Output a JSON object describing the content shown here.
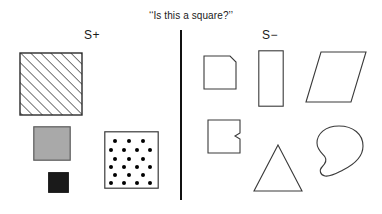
{
  "figure": {
    "title": "‘‘Is this a square?’’",
    "background_color": "#ffffff",
    "width": 382,
    "height": 214
  },
  "divider": {
    "name": "vertical-divider",
    "color": "#111111",
    "orientation": "vertical"
  },
  "categories": {
    "positive": {
      "label": "S+",
      "meaning": "positive-exemplars"
    },
    "negative": {
      "label": "S−",
      "meaning": "negative-exemplars"
    }
  },
  "colors": {
    "outline": "#3a3a3a",
    "hatch": "#2b2b2b",
    "gray_fill": "#a9a9a9",
    "black_fill": "#1a1a1a",
    "dot_fill": "#000000",
    "divider": "#111111",
    "text": "#1a1a1a"
  },
  "positive_shapes": [
    {
      "name": "hatched-square",
      "description": "square with diagonal hatch lines",
      "fill": "hatched",
      "x": 19,
      "y": 52,
      "width": 64,
      "height": 64
    },
    {
      "name": "gray-square",
      "description": "solid gray filled square",
      "fill": "#a9a9a9",
      "x": 33,
      "y": 126,
      "width": 38,
      "height": 35
    },
    {
      "name": "black-square",
      "description": "small solid black square",
      "fill": "#1a1a1a",
      "x": 48,
      "y": 172,
      "width": 21,
      "height": 21
    },
    {
      "name": "dotted-square",
      "description": "white square filled with staggered dot pattern",
      "fill": "dots",
      "x": 104,
      "y": 131,
      "width": 55,
      "height": 58,
      "dot_rows": 6,
      "dot_counts": [
        3,
        4,
        3,
        4,
        3,
        4
      ]
    }
  ],
  "negative_shapes": [
    {
      "name": "beveled-corner-square",
      "description": "square with clipped top-right corner",
      "x": 203,
      "y": 55,
      "width": 34,
      "height": 35
    },
    {
      "name": "tall-rectangle",
      "description": "tall vertical rectangle",
      "x": 258,
      "y": 50,
      "width": 26,
      "height": 57
    },
    {
      "name": "parallelogram",
      "description": "slanted parallelogram leaning right",
      "x": 305,
      "y": 51,
      "width": 62,
      "height": 52
    },
    {
      "name": "notched-square",
      "description": "square with small notch on right edge",
      "x": 207,
      "y": 119,
      "width": 34,
      "height": 35
    },
    {
      "name": "triangle",
      "description": "isosceles triangle",
      "x": 253,
      "y": 144,
      "width": 50,
      "height": 48
    },
    {
      "name": "blob",
      "description": "irregular closed blob with concave notch at lower left",
      "x": 315,
      "y": 124,
      "width": 50,
      "height": 54
    }
  ]
}
